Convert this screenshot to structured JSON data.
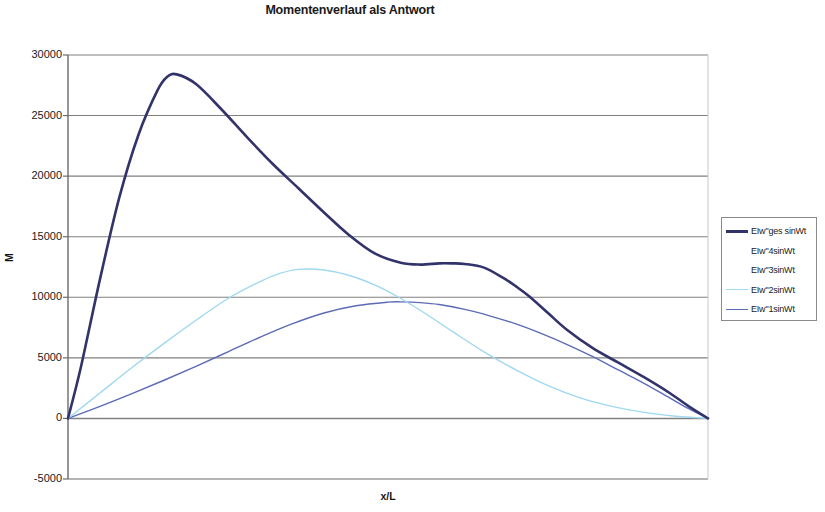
{
  "chart_data": {
    "type": "line",
    "title": "Momentenverlauf als Antwort",
    "xlabel": "x/L",
    "ylabel": "M",
    "grid": true,
    "legend_position": "right",
    "xlim": [
      0,
      1
    ],
    "ylim": [
      -5000,
      30000
    ],
    "ytick_labels": [
      "30000",
      "25000",
      "20000",
      "15000",
      "10000",
      "5000",
      "0",
      "-5000"
    ],
    "yticks": [
      30000,
      25000,
      20000,
      15000,
      10000,
      5000,
      0,
      -5000
    ],
    "xticks": [
      0,
      1
    ],
    "xtick_labels": [
      "",
      ""
    ],
    "series": [
      {
        "name": "EIw\"ges sinWt",
        "color": "#33336b",
        "width": 2.6,
        "x": [
          0.0,
          0.02,
          0.05,
          0.08,
          0.11,
          0.14,
          0.155,
          0.17,
          0.2,
          0.24,
          0.28,
          0.32,
          0.36,
          0.4,
          0.44,
          0.48,
          0.52,
          0.55,
          0.58,
          0.6,
          0.62,
          0.65,
          0.68,
          0.7,
          0.72,
          0.75,
          0.78,
          0.82,
          0.86,
          0.9,
          0.94,
          0.97,
          1.0
        ],
        "y": [
          0,
          4200,
          11500,
          18200,
          23400,
          27100,
          28200,
          28400,
          27600,
          25500,
          23200,
          21000,
          19000,
          17000,
          15100,
          13600,
          12850,
          12700,
          12800,
          12800,
          12750,
          12450,
          11600,
          10900,
          10100,
          8700,
          7300,
          5800,
          4600,
          3400,
          2100,
          1000,
          0
        ]
      },
      {
        "name": "EIw\"4sinWt",
        "color": "#ffffff",
        "width": 0.9,
        "x": [
          0.0,
          1.0
        ],
        "y": [
          0,
          0
        ]
      },
      {
        "name": "EIw\"3sinWt",
        "color": "#ffffff",
        "width": 0.9,
        "x": [
          0.0,
          1.0
        ],
        "y": [
          0,
          0
        ]
      },
      {
        "name": "EIw\"2sinWt",
        "color": "#9fd8ef",
        "width": 1.4,
        "x": [
          0.0,
          0.05,
          0.1,
          0.15,
          0.2,
          0.25,
          0.3,
          0.33,
          0.36,
          0.4,
          0.44,
          0.48,
          0.52,
          0.56,
          0.6,
          0.65,
          0.7,
          0.75,
          0.8,
          0.85,
          0.9,
          0.95,
          1.0
        ],
        "y": [
          0,
          2100,
          4200,
          6200,
          8100,
          9900,
          11300,
          11950,
          12300,
          12250,
          11800,
          11000,
          9900,
          8600,
          7200,
          5500,
          4000,
          2700,
          1700,
          1000,
          500,
          180,
          0
        ]
      },
      {
        "name": "EIw\"1sinWt",
        "color": "#5c6bb5",
        "width": 1.4,
        "x": [
          0.0,
          0.05,
          0.1,
          0.15,
          0.2,
          0.25,
          0.3,
          0.35,
          0.4,
          0.45,
          0.5,
          0.52,
          0.55,
          0.58,
          0.62,
          0.66,
          0.7,
          0.74,
          0.78,
          0.82,
          0.86,
          0.9,
          0.94,
          0.97,
          1.0
        ],
        "y": [
          0,
          1000,
          2050,
          3150,
          4300,
          5500,
          6700,
          7800,
          8700,
          9300,
          9600,
          9620,
          9560,
          9400,
          9000,
          8450,
          7800,
          7000,
          6100,
          5100,
          4000,
          2900,
          1700,
          800,
          0
        ]
      }
    ]
  },
  "legend": {
    "items": [
      {
        "label": "EIw\"ges sinWt",
        "color": "#33336b",
        "has_swatch": true,
        "width": 3
      },
      {
        "label": "EIw\"4sinWt",
        "color": "#ffffff",
        "has_swatch": false,
        "width": 1
      },
      {
        "label": "EIw\"3sinWt",
        "color": "#ffffff",
        "has_swatch": false,
        "width": 1
      },
      {
        "label": "EIw\"2sinWt",
        "color": "#9fd8ef",
        "has_swatch": true,
        "width": 1.5
      },
      {
        "label": "EIw\"1sinWt",
        "color": "#5c6bb5",
        "has_swatch": true,
        "width": 1.5
      }
    ]
  },
  "axes": {
    "plot_left": 68,
    "plot_right": 708,
    "plot_top": 55,
    "plot_bottom": 479,
    "grid_color": "#808080",
    "axis_color": "#6b6b6b"
  }
}
